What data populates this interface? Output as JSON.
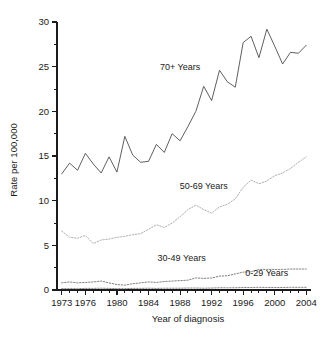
{
  "chart_data": {
    "type": "line",
    "title": "",
    "xlabel": "Year of diagnosis",
    "ylabel": "Rate per 100,000",
    "xlim": [
      1972.4,
      2004.6
    ],
    "ylim": [
      0,
      30
    ],
    "grid": false,
    "legend_position": "inline-annotations",
    "x_tick_labels": [
      "1973",
      "1976",
      "1980",
      "1984",
      "1988",
      "1992",
      "1996",
      "2000",
      "2004"
    ],
    "x_tick_values": [
      1973,
      1976,
      1980,
      1984,
      1988,
      1992,
      1996,
      2000,
      2004
    ],
    "x_minor_step": 1,
    "y_tick_labels": [
      "0",
      "5",
      "10",
      "15",
      "20",
      "25",
      "30"
    ],
    "y_tick_values": [
      0,
      5,
      10,
      15,
      20,
      25,
      30
    ],
    "y_minor_step": 2.5,
    "x": [
      1973,
      1974,
      1975,
      1976,
      1977,
      1978,
      1979,
      1980,
      1981,
      1982,
      1983,
      1984,
      1985,
      1986,
      1987,
      1988,
      1989,
      1990,
      1991,
      1992,
      1993,
      1994,
      1995,
      1996,
      1997,
      1998,
      1999,
      2000,
      2001,
      2002,
      2003,
      2004
    ],
    "series": [
      {
        "name": "70+ Years",
        "label": "70+ Years",
        "style": "solid",
        "color": "#4d4d4d",
        "label_x": 1988.0,
        "label_y": 24.6,
        "values": [
          13.0,
          14.2,
          13.4,
          15.3,
          14.1,
          13.1,
          14.9,
          13.2,
          17.2,
          15.1,
          14.3,
          14.4,
          16.3,
          15.4,
          17.5,
          16.7,
          18.3,
          20.0,
          22.8,
          21.2,
          24.6,
          23.3,
          22.7,
          27.7,
          28.4,
          26.0,
          29.2,
          27.3,
          25.3,
          26.6,
          26.5,
          27.4
        ]
      },
      {
        "name": "50-69 Years",
        "label": "50-69 Years",
        "style": "dotted",
        "color": "#b0b0b0",
        "label_x": 1991.0,
        "label_y": 11.3,
        "values": [
          6.6,
          5.9,
          5.8,
          6.1,
          5.2,
          5.6,
          5.7,
          5.9,
          6.0,
          6.2,
          6.3,
          6.8,
          7.3,
          7.0,
          7.5,
          8.2,
          9.0,
          9.5,
          9.0,
          8.6,
          9.3,
          9.6,
          10.2,
          11.5,
          12.3,
          11.9,
          12.2,
          12.8,
          13.1,
          13.6,
          14.3,
          14.9
        ]
      },
      {
        "name": "30-49 Years",
        "label": "30-49 Years",
        "style": "dotted",
        "color": "#808080",
        "label_x": 1988.2,
        "label_y": 3.3,
        "values": [
          0.8,
          0.9,
          0.8,
          0.85,
          0.9,
          1.0,
          0.8,
          0.6,
          0.55,
          0.7,
          0.8,
          0.9,
          0.85,
          0.95,
          1.0,
          1.05,
          1.1,
          1.35,
          1.3,
          1.35,
          1.55,
          1.6,
          1.8,
          2.0,
          2.05,
          2.3,
          2.3,
          2.3,
          2.3,
          2.35,
          2.35,
          2.35
        ]
      },
      {
        "name": "0-29 Years",
        "label": "0-29 Years",
        "style": "dotted",
        "color": "#808080",
        "label_x": 1999.0,
        "label_y": 1.6,
        "values": [
          0.15,
          0.15,
          0.15,
          0.18,
          0.18,
          0.2,
          0.18,
          0.15,
          0.15,
          0.18,
          0.18,
          0.2,
          0.18,
          0.2,
          0.2,
          0.2,
          0.22,
          0.22,
          0.2,
          0.22,
          0.25,
          0.25,
          0.25,
          0.28,
          0.28,
          0.3,
          0.28,
          0.28,
          0.28,
          0.3,
          0.3,
          0.3
        ]
      }
    ]
  }
}
